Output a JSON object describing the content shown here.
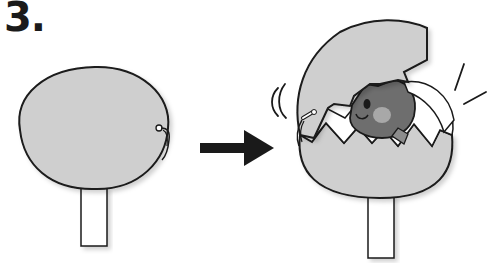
{
  "step": {
    "number": "3."
  },
  "colors": {
    "shell_fill": "#cfcfcf",
    "outline": "#1a1a1a",
    "chick_body": "#6e6e6e",
    "chick_cheek": "#a8a8a8",
    "shell_inner": "#ffffff",
    "stick": "#ffffff",
    "arrow": "#1a1a1a"
  },
  "panels": [
    {
      "label": "before",
      "description": "Intact egg on a stick with a pull-string tab"
    },
    {
      "label": "after",
      "description": "Egg cracked open revealing a chick, with motion marks"
    }
  ]
}
